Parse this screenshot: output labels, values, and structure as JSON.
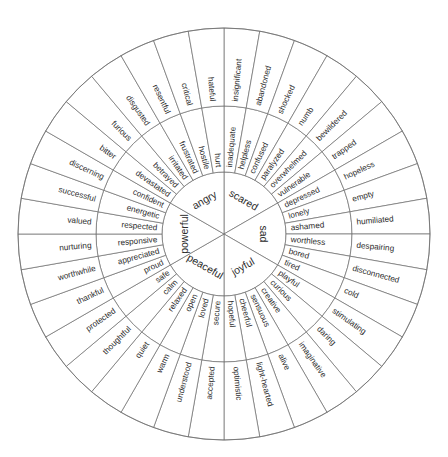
{
  "wheel": {
    "title": "Emotion Wheel",
    "center": {
      "x": 224,
      "y": 234
    },
    "radii": {
      "core": 62,
      "middle": 128,
      "outer": 206
    },
    "start_angle_deg": -90,
    "colors": {
      "stroke": "#6b6b6b",
      "text": "#2b2b2b",
      "background": "#ffffff"
    },
    "sectors": [
      {
        "core": "scared",
        "middle": [
          "inadequate",
          "helpless",
          "confused",
          "paralyzed",
          "overwhelmed",
          "vulnerable"
        ],
        "outer": [
          "insignificant",
          "abandoned",
          "shocked",
          "numb",
          "bewildered",
          "trapped"
        ]
      },
      {
        "core": "sad",
        "middle": [
          "depressed",
          "lonely",
          "ashamed",
          "worthless",
          "bored",
          "tired"
        ],
        "outer": [
          "hopeless",
          "empty",
          "humiliated",
          "despairing",
          "disconnected",
          "cold"
        ]
      },
      {
        "core": "joyful",
        "middle": [
          "playful",
          "curious",
          "creative",
          "sensuous",
          "cheerful",
          "hopeful"
        ],
        "outer": [
          "stimulating",
          "daring",
          "imaginative",
          "alive",
          "light-hearted",
          "optimistic"
        ]
      },
      {
        "core": "peaceful",
        "middle": [
          "secure",
          "loved",
          "open",
          "relaxed",
          "calm",
          "safe"
        ],
        "outer": [
          "accepted",
          "understood",
          "warm",
          "quiet",
          "thoughtful",
          "protected"
        ]
      },
      {
        "core": "powerful",
        "middle": [
          "proud",
          "appreciated",
          "responsive",
          "respected",
          "energetic",
          "confident"
        ],
        "outer": [
          "thankful",
          "worthwhile",
          "nurturing",
          "valued",
          "successful",
          "discerning"
        ]
      },
      {
        "core": "angry",
        "middle": [
          "devastated",
          "betrayed",
          "irritated",
          "frustrated",
          "hostile",
          "hurt"
        ],
        "outer": [
          "bitter",
          "furious",
          "disgusted",
          "resentful",
          "critical",
          "hateful"
        ]
      }
    ]
  }
}
